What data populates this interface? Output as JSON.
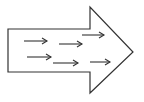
{
  "diagram": {
    "type": "block-arrow-with-flow-arrows",
    "stroke_color": "#333333",
    "background": "#ffffff",
    "big_arrow": {
      "direction": "right",
      "points": [
        [
          8,
          29
        ],
        [
          90,
          29
        ],
        [
          90,
          7
        ],
        [
          133,
          52
        ],
        [
          90,
          93
        ],
        [
          90,
          72
        ],
        [
          8,
          72
        ]
      ]
    },
    "inner_arrows": [
      {
        "x1": 24,
        "y1": 41,
        "x2": 47,
        "y2": 41
      },
      {
        "x1": 59,
        "y1": 44,
        "x2": 82,
        "y2": 44
      },
      {
        "x1": 82,
        "y1": 35,
        "x2": 104,
        "y2": 35
      },
      {
        "x1": 27,
        "y1": 57,
        "x2": 51,
        "y2": 57
      },
      {
        "x1": 53,
        "y1": 63,
        "x2": 78,
        "y2": 63
      },
      {
        "x1": 90,
        "y1": 62,
        "x2": 110,
        "y2": 62
      }
    ]
  }
}
